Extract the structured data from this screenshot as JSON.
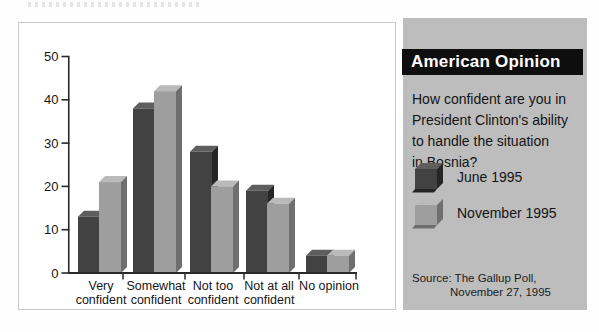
{
  "chart_data": {
    "type": "bar",
    "title": "",
    "xlabel": "",
    "ylabel": "",
    "categories": [
      "Very confident",
      "Somewhat confident",
      "Not too confident",
      "Not at all confident",
      "No opinion"
    ],
    "category_lines": [
      [
        "Very",
        "confident"
      ],
      [
        "Somewhat",
        "confident"
      ],
      [
        "Not too",
        "confident"
      ],
      [
        "Not at all",
        "confident"
      ],
      [
        "No opinion"
      ]
    ],
    "series": [
      {
        "name": "June 1995",
        "values": [
          13,
          38,
          28,
          19,
          4
        ],
        "color": "#424242",
        "color_top": "#5e5e5e",
        "color_side": "#262626"
      },
      {
        "name": "November 1995",
        "values": [
          21,
          42,
          20,
          16,
          4
        ],
        "color": "#9e9e9e",
        "color_top": "#bababa",
        "color_side": "#6f6f6f"
      }
    ],
    "ylim": [
      0,
      50
    ],
    "yticks": [
      0,
      10,
      20,
      30,
      40,
      50
    ],
    "grid": false,
    "legend_position": "right-panel",
    "axis_color": "#2a2a2a"
  },
  "panel": {
    "banner_title": "American Opinion",
    "question_lines": [
      "How confident are you in",
      "President Clinton's ability",
      "to handle the situation",
      "in Bosnia?"
    ],
    "source_line1": "Source: The Gallup Poll,",
    "source_line2": "November 27, 1995",
    "colors": {
      "panel_bg": "#bdbdbd",
      "banner_bg": "#0e0e0e",
      "banner_text": "#ffffff"
    }
  }
}
